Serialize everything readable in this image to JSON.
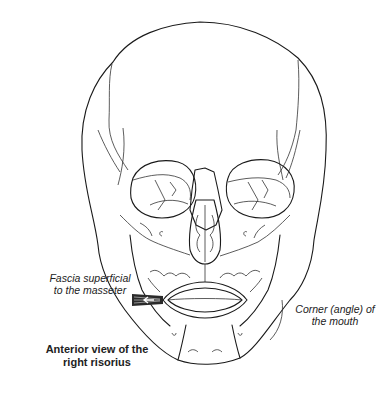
{
  "figure": {
    "labels": {
      "fascia": "Fascia superficial to the masseter",
      "fascia_line1": "Fascia superficial",
      "fascia_line2": "to the masseter",
      "corner_line1": "Corner (angle) of",
      "corner_line2": "the mouth",
      "caption_line1": "Anterior view of the",
      "caption_line2": "right risorius"
    },
    "colors": {
      "line": "#1a1a1a",
      "background": "#ffffff",
      "muscle_fill": "#2a2a2a"
    }
  }
}
